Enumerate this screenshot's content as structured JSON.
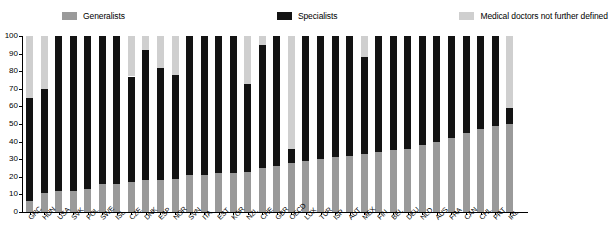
{
  "legend": {
    "items": [
      {
        "label": "Generalists",
        "color": "#9a9a9a",
        "key": "generalists"
      },
      {
        "label": "Specialists",
        "color": "#131313",
        "key": "specialists"
      },
      {
        "label": "Medical doctors not further defined",
        "color": "#cfcfcf",
        "key": "not_further_defined"
      }
    ]
  },
  "chart_data": {
    "type": "bar",
    "subtype": "stacked-column-100-percent",
    "title": "",
    "xlabel": "",
    "ylabel": "",
    "ylim": [
      0,
      100
    ],
    "yticks": [
      0,
      10,
      20,
      30,
      40,
      50,
      60,
      70,
      80,
      90,
      100
    ],
    "ytick_labels": [
      "0",
      "10",
      "20",
      "30",
      "40",
      "50",
      "60",
      "70",
      "80",
      "90",
      "100"
    ],
    "grid": false,
    "legend_position": "top",
    "stack_order_bottom_to_top": [
      "generalists",
      "specialists",
      "not_further_defined"
    ],
    "categories": [
      "GRC",
      "HUN",
      "USA",
      "SVK",
      "POL",
      "SWE",
      "ISL",
      "CZE",
      "DNK",
      "ESP",
      "NOR",
      "SVN",
      "ITA",
      "EST",
      "KOR",
      "NZL",
      "CHE",
      "GBR",
      "OECD",
      "LUX",
      "TUR",
      "ISR",
      "AUT",
      "MEX",
      "FIN",
      "BEL",
      "DEU",
      "NLD",
      "AUS",
      "FRA",
      "CAN",
      "CHL",
      "PRT",
      "IRL"
    ],
    "series": [
      {
        "name": "Generalists",
        "key": "generalists",
        "color": "#9a9a9a",
        "values": [
          6,
          11,
          12,
          12,
          13,
          16,
          16,
          17,
          18,
          18,
          19,
          21,
          21,
          22,
          22,
          23,
          25,
          26,
          28,
          29,
          30,
          31,
          32,
          33,
          34,
          35,
          36,
          38,
          40,
          42,
          45,
          47,
          49,
          50
        ]
      },
      {
        "name": "Specialists",
        "key": "specialists",
        "color": "#131313",
        "values": [
          59,
          59,
          88,
          88,
          87,
          84,
          84,
          60,
          74,
          64,
          59,
          79,
          79,
          78,
          78,
          50,
          70,
          74,
          8,
          71,
          70,
          69,
          68,
          55,
          66,
          65,
          64,
          62,
          60,
          58,
          55,
          53,
          51,
          9
        ]
      },
      {
        "name": "Medical doctors not further defined",
        "key": "not_further_defined",
        "color": "#cfcfcf",
        "values": [
          35,
          30,
          0,
          0,
          0,
          0,
          0,
          23,
          8,
          18,
          22,
          0,
          0,
          0,
          0,
          27,
          5,
          0,
          64,
          0,
          0,
          0,
          0,
          12,
          0,
          0,
          0,
          0,
          0,
          0,
          0,
          0,
          0,
          41
        ]
      }
    ]
  }
}
